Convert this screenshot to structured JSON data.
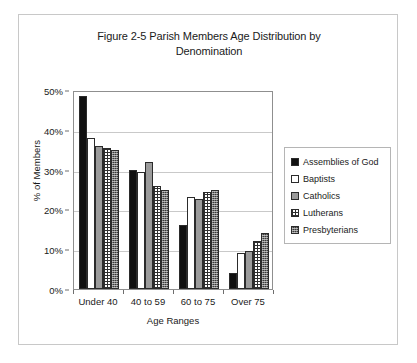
{
  "chart_data": {
    "type": "bar",
    "title": "Figure 2-5 Parish Members Age Distribution by Denomination",
    "title_line1": "Figure 2-5 Parish Members Age Distribution by",
    "title_line2": "Denomination",
    "xlabel": "Age Ranges",
    "ylabel": "% of Members",
    "categories": [
      "Under 40",
      "40 to 59",
      "60 to 75",
      "Over 75"
    ],
    "ylim": [
      0,
      50
    ],
    "ytick_labels": [
      "0%",
      "10%",
      "20%",
      "30%",
      "40%",
      "50%"
    ],
    "ytick_values": [
      0,
      10,
      20,
      30,
      40,
      50
    ],
    "grid": true,
    "legend_position": "right",
    "series": [
      {
        "name": "Assemblies of God",
        "color": "#111111",
        "values": [
          48.5,
          30.0,
          16.0,
          4.0
        ]
      },
      {
        "name": "Baptists",
        "color": "#ffffff",
        "values": [
          38.0,
          29.5,
          23.0,
          9.0
        ]
      },
      {
        "name": "Catholics",
        "color": "#9b9b9b",
        "values": [
          36.0,
          32.0,
          22.5,
          9.5
        ]
      },
      {
        "name": "Lutherans",
        "color": "#ffffff",
        "values": [
          35.5,
          26.0,
          24.5,
          12.0
        ]
      },
      {
        "name": "Presbyterians",
        "color": "#3a3a3a",
        "values": [
          35.0,
          25.0,
          25.0,
          14.0
        ]
      }
    ]
  }
}
